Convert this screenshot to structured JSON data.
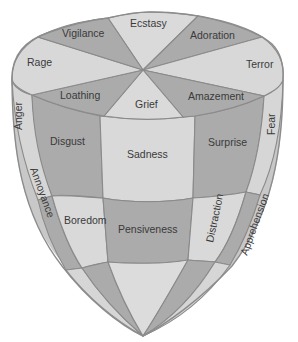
{
  "diagram": {
    "colors": {
      "light": "#dcdcdc",
      "mid": "#c4c4c4",
      "dark": "#a9a9a9",
      "line": "#8a8a8a",
      "text": "#3a3a3a",
      "background": "#ffffff"
    },
    "top_face": {
      "labels": {
        "ecstasy": "Ecstasy",
        "adoration": "Adoration",
        "terror": "Terror",
        "amazement": "Amazement",
        "grief": "Grief",
        "loathing": "Loathing",
        "rage": "Rage",
        "vigilance": "Vigilance"
      }
    },
    "band_1": {
      "labels": {
        "anger": "Anger",
        "disgust": "Disgust",
        "sadness": "Sadness",
        "surprise": "Surprise",
        "fear": "Fear"
      }
    },
    "band_2": {
      "labels": {
        "annoyance": "Annoyance",
        "boredom": "Boredom",
        "pensiveness": "Pensiveness",
        "distraction": "Distraction",
        "apprehension": "Apprehension"
      }
    }
  }
}
